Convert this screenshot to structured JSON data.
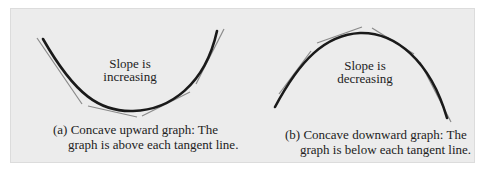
{
  "figure": {
    "panel_background": "#ececec",
    "curve_color": "#1a1a1a",
    "tangent_color": "#8a8a8a",
    "left": {
      "shape": "concave-upward",
      "label_line1": "Slope is",
      "label_line2": "increasing",
      "caption_line1": "(a) Concave upward graph: The",
      "caption_line2": "graph is above each tangent line.",
      "tangent_count": 4
    },
    "right": {
      "shape": "concave-downward",
      "label_line1": "Slope is",
      "label_line2": "decreasing",
      "caption_line1": "(b) Concave downward graph: The",
      "caption_line2": "graph is below each tangent line.",
      "tangent_count": 4
    }
  }
}
